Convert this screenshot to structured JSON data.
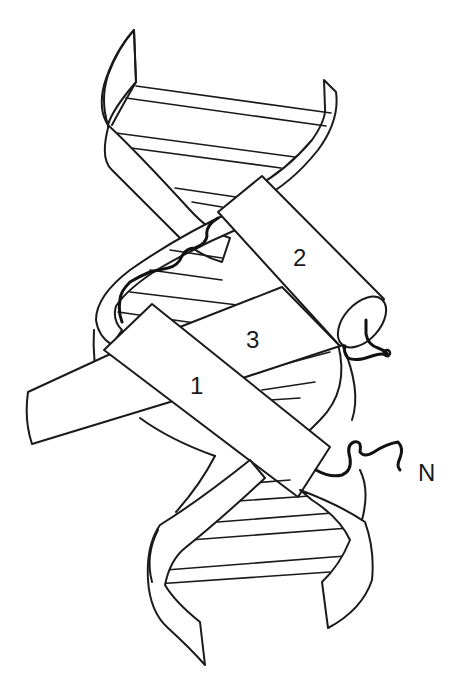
{
  "figure": {
    "colors": {
      "ink": "#1a1a1a",
      "background": "#ffffff"
    },
    "labels": {
      "helix1": "1",
      "helix2": "2",
      "helix3": "3",
      "n_terminus": "N"
    },
    "elements": [
      {
        "id": "dna-backbone-strand-a",
        "type": "ribbon"
      },
      {
        "id": "dna-backbone-strand-b",
        "type": "ribbon"
      },
      {
        "id": "base-pair-rungs",
        "type": "lines"
      },
      {
        "id": "alpha-helix-1",
        "type": "cylinder",
        "label": "1"
      },
      {
        "id": "alpha-helix-2",
        "type": "cylinder",
        "label": "2"
      },
      {
        "id": "alpha-helix-3",
        "type": "cylinder",
        "label": "3"
      },
      {
        "id": "n-terminal-tail",
        "type": "coil",
        "label": "N"
      },
      {
        "id": "loop-1-2",
        "type": "coil"
      },
      {
        "id": "c-terminal-tail",
        "type": "coil"
      }
    ]
  }
}
